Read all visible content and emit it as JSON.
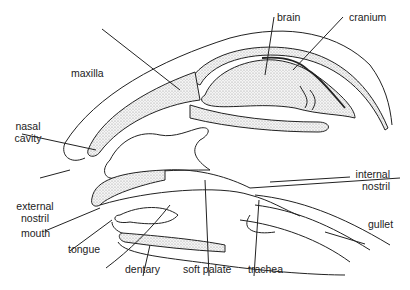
{
  "diagram": {
    "labels": {
      "brain": "brain",
      "cranium": "cranium",
      "maxilla": "maxilla",
      "nasal_cavity_1": "nasal",
      "nasal_cavity_2": "cavity",
      "internal_nostril_1": "internal",
      "internal_nostril_2": "nostril",
      "external_nostril_1": "external",
      "external_nostril_2": "nostril",
      "gullet": "gullet",
      "mouth": "mouth",
      "tongue": "tongue",
      "dentary": "dentary",
      "soft_palate": "soft palate",
      "trachea": "trachea"
    },
    "colors": {
      "line": "#222222",
      "stipple": "#bdbdbd",
      "background": "#ffffff"
    }
  }
}
